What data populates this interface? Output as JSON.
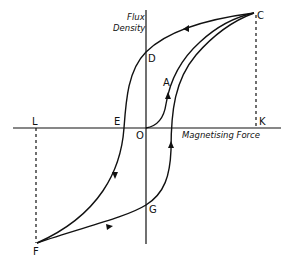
{
  "diagram": {
    "y_axis_label_line1": "Flux",
    "y_axis_label_line2": "Density",
    "x_axis_label": "Magnetising Force",
    "points": {
      "origin": "O",
      "initial_curve": "A",
      "saturation_positive": "C",
      "remanence_positive": "D",
      "coercive_negative": "E",
      "saturation_negative": "F",
      "remanence_negative": "G",
      "projection_positive": "K",
      "projection_negative": "L"
    },
    "colors": {
      "ink": "#111111",
      "background": "#ffffff"
    }
  }
}
